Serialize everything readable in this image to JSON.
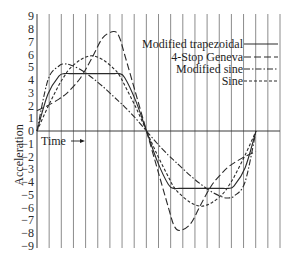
{
  "chart_data": {
    "type": "line",
    "title": "",
    "xlabel": "Time",
    "ylabel": "Acceleration",
    "ylim": [
      -9,
      9
    ],
    "yticks": [
      9,
      8,
      7,
      6,
      5,
      4,
      3,
      2,
      1,
      0,
      -1,
      -2,
      -3,
      -4,
      -5,
      -6,
      -7,
      -8,
      -9
    ],
    "ytick_labels": [
      "9",
      "8",
      "7",
      "6",
      "5",
      "4",
      "3",
      "2",
      "1",
      "0",
      "-1",
      "-2",
      "-3",
      "-4",
      "-5",
      "-6",
      "-7",
      "-8",
      "-9"
    ],
    "xlim": [
      0,
      1
    ],
    "grid": {
      "vertical": true,
      "horizontal_zero_line": true,
      "vertical_line_count": 19
    },
    "legend": {
      "position": "upper right",
      "entries": [
        {
          "label": "Modified trapezoidal",
          "style": "solid"
        },
        {
          "label": "4-Stop Geneva",
          "style": "long-dash"
        },
        {
          "label": "Modified sine",
          "style": "dash-dot"
        },
        {
          "label": "Sine",
          "style": "short-dash"
        }
      ]
    },
    "x": [
      0,
      0.05,
      0.1,
      0.125,
      0.15,
      0.2,
      0.25,
      0.3,
      0.35,
      0.375,
      0.4,
      0.45,
      0.5,
      0.55,
      0.6,
      0.625,
      0.65,
      0.7,
      0.75,
      0.8,
      0.85,
      0.875,
      0.9,
      0.95,
      1.0
    ],
    "series": [
      {
        "name": "Modified trapezoidal",
        "style": "solid",
        "values": [
          0,
          2.9,
          4.3,
          4.5,
          4.5,
          4.5,
          4.5,
          4.5,
          4.5,
          4.5,
          4.2,
          2.4,
          0,
          -2.4,
          -4.2,
          -4.5,
          -4.5,
          -4.5,
          -4.5,
          -4.5,
          -4.5,
          -4.5,
          -4.3,
          -2.9,
          0
        ]
      },
      {
        "name": "4-Stop Geneva",
        "style": "long-dash",
        "values": [
          1.6,
          2.0,
          2.5,
          2.8,
          3.2,
          4.2,
          5.7,
          7.3,
          7.8,
          7.4,
          6.0,
          3.0,
          0,
          -3.0,
          -6.0,
          -7.4,
          -7.8,
          -7.3,
          -5.7,
          -4.2,
          -3.2,
          -2.8,
          -2.5,
          -2.0,
          -1.6
        ]
      },
      {
        "name": "Modified sine",
        "style": "dash-dot",
        "values": [
          0,
          4.0,
          5.1,
          5.25,
          5.2,
          4.8,
          4.2,
          3.5,
          2.7,
          2.3,
          1.9,
          1.0,
          0,
          -1.0,
          -1.9,
          -2.3,
          -2.7,
          -3.5,
          -4.2,
          -4.8,
          -5.2,
          -5.25,
          -5.1,
          -4.0,
          0
        ]
      },
      {
        "name": "Sine",
        "style": "short-dash",
        "values": [
          0,
          1.9,
          3.6,
          4.3,
          4.9,
          5.6,
          5.9,
          5.6,
          4.9,
          4.4,
          3.6,
          1.9,
          0,
          -1.9,
          -3.6,
          -4.4,
          -4.9,
          -5.6,
          -5.9,
          -5.6,
          -4.9,
          -4.3,
          -3.6,
          -1.9,
          0
        ]
      }
    ]
  },
  "annotations": {
    "time_label": "Time",
    "time_arrow": "→"
  }
}
